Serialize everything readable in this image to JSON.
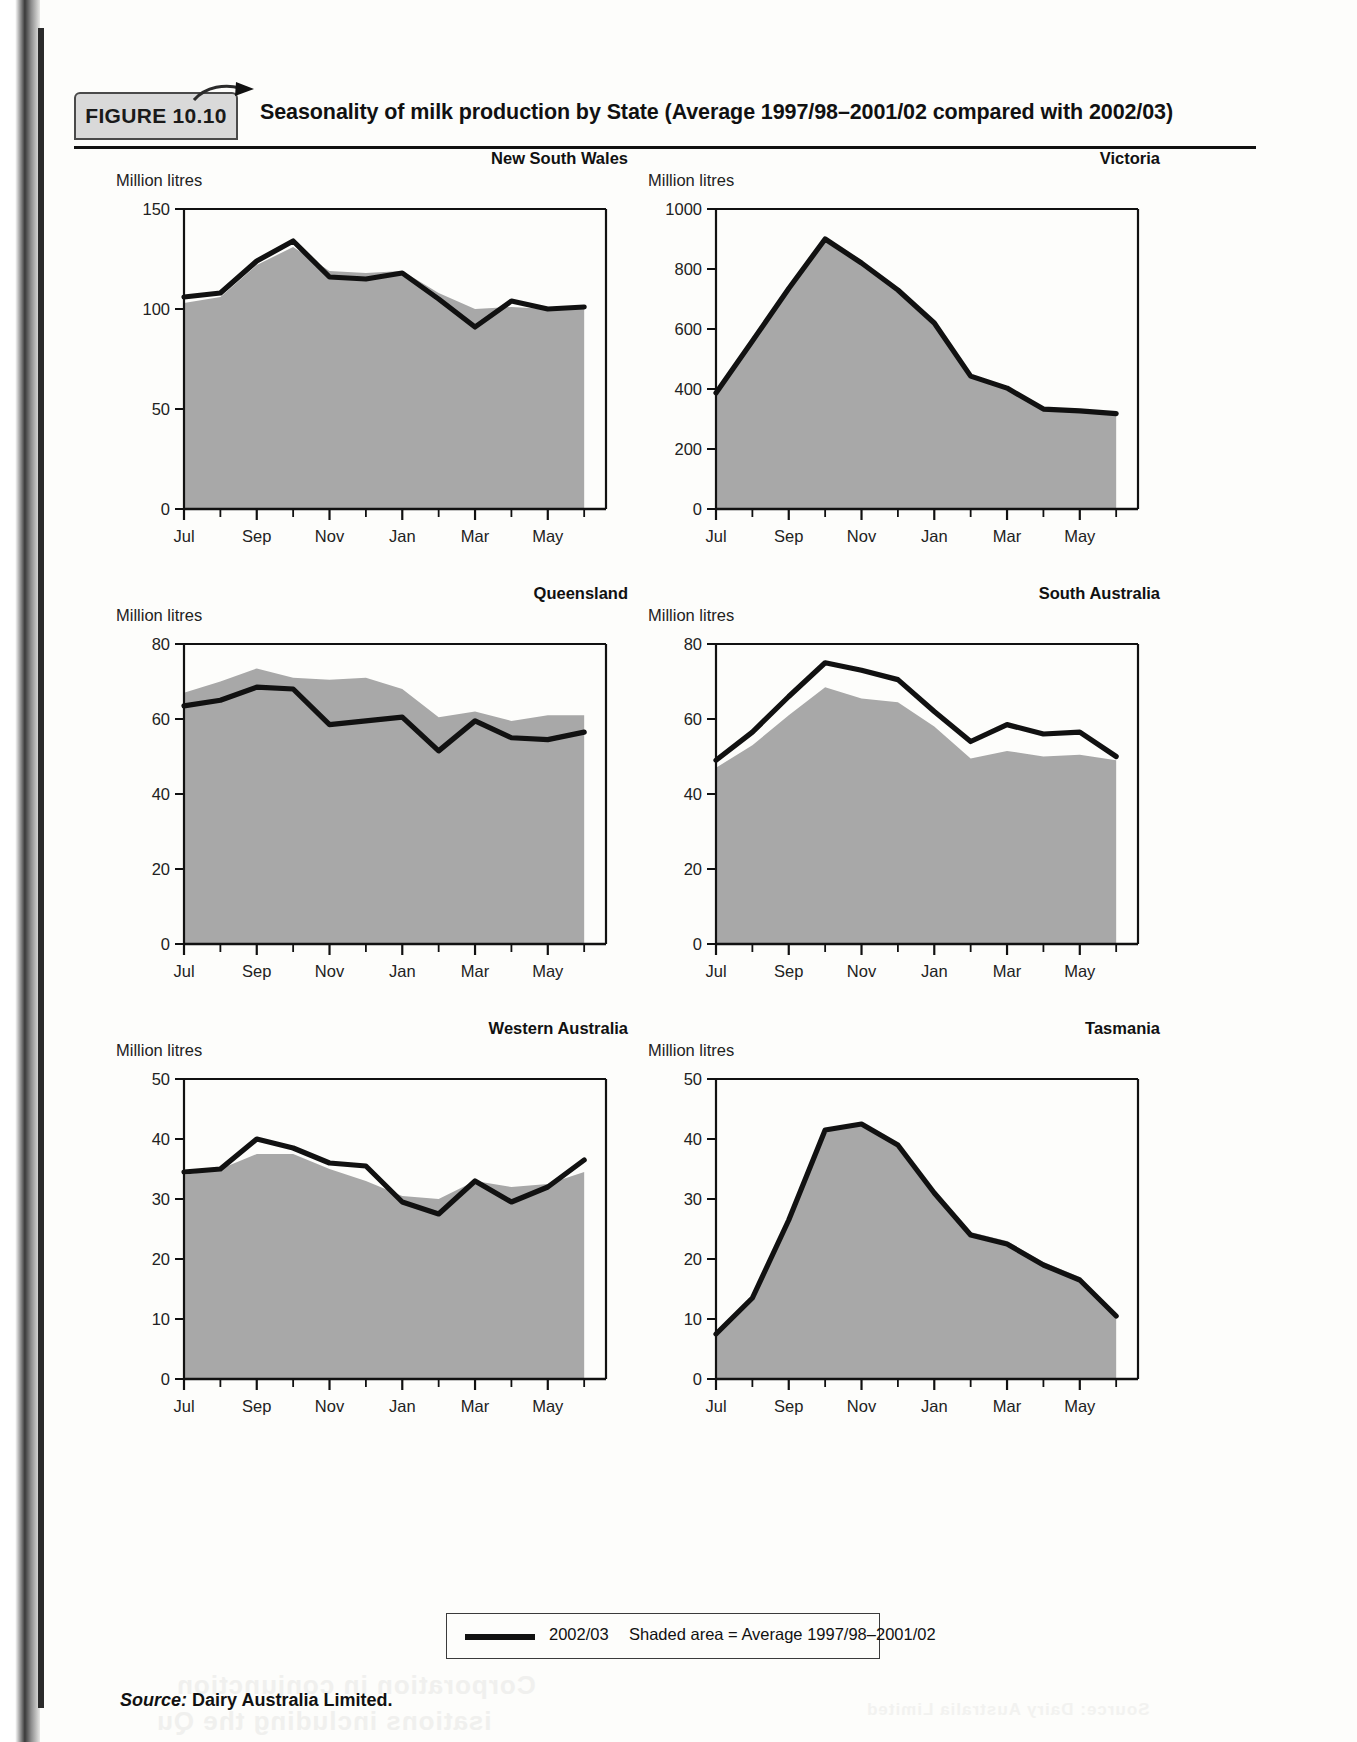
{
  "figure": {
    "badge": "FIGURE 10.10",
    "title": "Seasonality of milk production by State (Average 1997/98–2001/02 compared with 2002/03)"
  },
  "legend": {
    "line_label": "2002/03",
    "shaded_label": "Shaded area = Average 1997/98–2001/02"
  },
  "source": {
    "prefix": "Source:",
    "text": "Dairy Australia Limited."
  },
  "common": {
    "y_axis_label": "Million litres",
    "x_tick_labels": [
      "Jul",
      "Sep",
      "Nov",
      "Jan",
      "Mar",
      "May"
    ],
    "months": [
      "Jul",
      "Aug",
      "Sep",
      "Oct",
      "Nov",
      "Dec",
      "Jan",
      "Feb",
      "Mar",
      "Apr",
      "May",
      "Jun"
    ],
    "series_names": [
      "2002/03",
      "Average 1997/98–2001/02"
    ],
    "line_color": "#111111",
    "shade_color": "#a8a8a8"
  },
  "chart_data": [
    {
      "type": "area",
      "title": "New South Wales",
      "xlabel": "",
      "ylabel": "Million litres",
      "ylim": [
        0,
        150
      ],
      "yticks": [
        0,
        50,
        100,
        150
      ],
      "grid": false,
      "legend_position": "bottom",
      "x": [
        "Jul",
        "Aug",
        "Sep",
        "Oct",
        "Nov",
        "Dec",
        "Jan",
        "Feb",
        "Mar",
        "Apr",
        "May",
        "Jun"
      ],
      "series": [
        {
          "name": "2002/03",
          "values": [
            106,
            108,
            124,
            134,
            116,
            115,
            118,
            105,
            91,
            104,
            100,
            101
          ]
        },
        {
          "name": "Average 1997/98–2001/02",
          "values": [
            103,
            106,
            122,
            131,
            119,
            118,
            119,
            108,
            100,
            101,
            100,
            101
          ]
        }
      ]
    },
    {
      "type": "area",
      "title": "Victoria",
      "xlabel": "",
      "ylabel": "Million litres",
      "ylim": [
        0,
        1000
      ],
      "yticks": [
        0,
        200,
        400,
        600,
        800,
        1000
      ],
      "grid": false,
      "legend_position": "bottom",
      "x": [
        "Jul",
        "Aug",
        "Sep",
        "Oct",
        "Nov",
        "Dec",
        "Jan",
        "Feb",
        "Mar",
        "Apr",
        "May",
        "Jun"
      ],
      "series": [
        {
          "name": "2002/03",
          "values": [
            387,
            560,
            735,
            900,
            820,
            730,
            620,
            443,
            403,
            333,
            327,
            318
          ]
        },
        {
          "name": "Average 1997/98–2001/02",
          "values": [
            387,
            560,
            735,
            900,
            820,
            730,
            620,
            443,
            403,
            333,
            327,
            318
          ]
        }
      ]
    },
    {
      "type": "area",
      "title": "Queensland",
      "xlabel": "",
      "ylabel": "Million litres",
      "ylim": [
        0,
        80
      ],
      "yticks": [
        0,
        20,
        40,
        60,
        80
      ],
      "grid": false,
      "legend_position": "bottom",
      "x": [
        "Jul",
        "Aug",
        "Sep",
        "Oct",
        "Nov",
        "Dec",
        "Jan",
        "Feb",
        "Mar",
        "Apr",
        "May",
        "Jun"
      ],
      "series": [
        {
          "name": "2002/03",
          "values": [
            63.5,
            65,
            68.5,
            68,
            58.5,
            59.5,
            60.5,
            51.5,
            59.5,
            55,
            54.5,
            56.5
          ]
        },
        {
          "name": "Average 1997/98–2001/02",
          "values": [
            67,
            70,
            73.5,
            71,
            70.5,
            71,
            68,
            60.5,
            62,
            59.5,
            61,
            61
          ]
        }
      ]
    },
    {
      "type": "area",
      "title": "South Australia",
      "xlabel": "",
      "ylabel": "Million litres",
      "ylim": [
        0,
        80
      ],
      "yticks": [
        0,
        20,
        40,
        60,
        80
      ],
      "grid": false,
      "legend_position": "bottom",
      "x": [
        "Jul",
        "Aug",
        "Sep",
        "Oct",
        "Nov",
        "Dec",
        "Jan",
        "Feb",
        "Mar",
        "Apr",
        "May",
        "Jun"
      ],
      "series": [
        {
          "name": "2002/03",
          "values": [
            49,
            56.5,
            66,
            75,
            73,
            70.5,
            62,
            54,
            58.5,
            56,
            56.5,
            50
          ]
        },
        {
          "name": "Average 1997/98–2001/02",
          "values": [
            47,
            53,
            61,
            68.5,
            65.5,
            64.5,
            58,
            49.5,
            51.5,
            50,
            50.5,
            49
          ]
        }
      ]
    },
    {
      "type": "area",
      "title": "Western Australia",
      "xlabel": "",
      "ylabel": "Million litres",
      "ylim": [
        0,
        50
      ],
      "yticks": [
        0,
        10,
        20,
        30,
        40,
        50
      ],
      "grid": false,
      "legend_position": "bottom",
      "x": [
        "Jul",
        "Aug",
        "Sep",
        "Oct",
        "Nov",
        "Dec",
        "Jan",
        "Feb",
        "Mar",
        "Apr",
        "May",
        "Jun"
      ],
      "series": [
        {
          "name": "2002/03",
          "values": [
            34.5,
            35,
            40,
            38.5,
            36,
            35.5,
            29.5,
            27.5,
            33,
            29.5,
            32,
            36.5
          ]
        },
        {
          "name": "Average 1997/98–2001/02",
          "values": [
            34,
            35,
            37.5,
            37.5,
            35,
            33,
            30.5,
            30,
            33,
            32,
            32.5,
            34.5
          ]
        }
      ]
    },
    {
      "type": "area",
      "title": "Tasmania",
      "xlabel": "",
      "ylabel": "Million litres",
      "ylim": [
        0,
        50
      ],
      "yticks": [
        0,
        10,
        20,
        30,
        40,
        50
      ],
      "grid": false,
      "legend_position": "bottom",
      "x": [
        "Jul",
        "Aug",
        "Sep",
        "Oct",
        "Nov",
        "Dec",
        "Jan",
        "Feb",
        "Mar",
        "Apr",
        "May",
        "Jun"
      ],
      "series": [
        {
          "name": "2002/03",
          "values": [
            7.5,
            13.5,
            26.5,
            41.5,
            42.5,
            39,
            31,
            24,
            22.5,
            19,
            16.5,
            10.5
          ]
        },
        {
          "name": "Average 1997/98–2001/02",
          "values": [
            7.5,
            13.5,
            26.5,
            41.5,
            42.5,
            39,
            31,
            24.5,
            23,
            19.5,
            17,
            10.5
          ]
        }
      ]
    }
  ]
}
